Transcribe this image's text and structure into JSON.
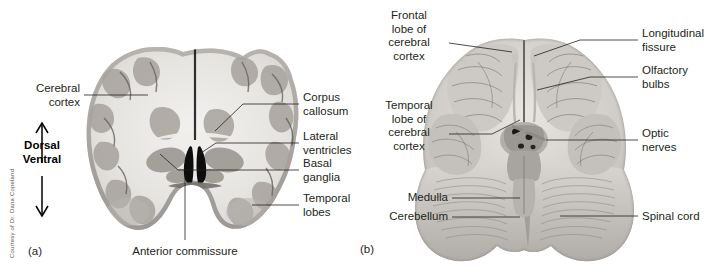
{
  "figure": {
    "credit": "Courtesy of Dr. Dana Copeland",
    "panel_a_caption": "(a)",
    "panel_b_caption": "(b)"
  },
  "orientation": {
    "dorsal": "Dorsal",
    "ventral": "Ventral",
    "up_arrow_icon": "arrow-up-icon",
    "down_arrow_icon": "arrow-down-icon"
  },
  "panel_a": {
    "view": "coronal-section-human-brain",
    "labels_left": [
      {
        "text": "Cerebral\ncortex",
        "align": "right"
      }
    ],
    "labels_right": [
      {
        "text": "Corpus\ncallosum",
        "align": "left"
      },
      {
        "text": "Lateral\nventricles",
        "align": "left"
      },
      {
        "text": "Basal\nganglia",
        "align": "left"
      },
      {
        "text": "Temporal\nlobes",
        "align": "left"
      }
    ],
    "labels_bottom": [
      {
        "text": "Anterior commissure",
        "align": "center"
      }
    ]
  },
  "panel_b": {
    "view": "ventral-view-human-brain",
    "labels_left": [
      {
        "text": "Frontal\nlobe of\ncerebral\ncortex",
        "align": "center"
      },
      {
        "text": "Temporal\nlobe of\ncerebral\ncortex",
        "align": "center"
      },
      {
        "text": "Medulla",
        "align": "right"
      },
      {
        "text": "Cerebellum",
        "align": "right"
      }
    ],
    "labels_right": [
      {
        "text": "Longitudinal\nfissure",
        "align": "left"
      },
      {
        "text": "Olfactory\nbulbs",
        "align": "left"
      },
      {
        "text": "Optic\nnerves",
        "align": "left"
      },
      {
        "text": "Spinal cord",
        "align": "left"
      }
    ]
  }
}
